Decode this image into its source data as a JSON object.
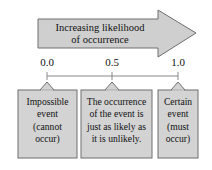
{
  "figure": {
    "arrow": {
      "label_line1": "Increasing likelihood",
      "label_line2": "of occurrence",
      "fill": "#cfcfcf",
      "stroke": "#6e6e6e"
    },
    "scale": {
      "line_color": "#8a8a8a",
      "ticks": [
        {
          "value": "0.0",
          "position": 0.0
        },
        {
          "value": "0.5",
          "position": 0.5
        },
        {
          "value": "1.0",
          "position": 1.0
        }
      ]
    },
    "boxes": [
      {
        "id": "impossible-event",
        "fill": "#d3d3d3",
        "stroke": "#6e6e6e",
        "lines": [
          "Impossible",
          "event",
          "(cannot",
          "occur)"
        ]
      },
      {
        "id": "equally-likely-event",
        "fill": "#d3d3d3",
        "stroke": "#6e6e6e",
        "lines": [
          "The occurrence",
          "of the event is",
          "just as likely as",
          "it is unlikely."
        ]
      },
      {
        "id": "certain-event",
        "fill": "#d3d3d3",
        "stroke": "#6e6e6e",
        "lines": [
          "Certain",
          "event",
          "(must",
          "occur)"
        ]
      }
    ]
  }
}
